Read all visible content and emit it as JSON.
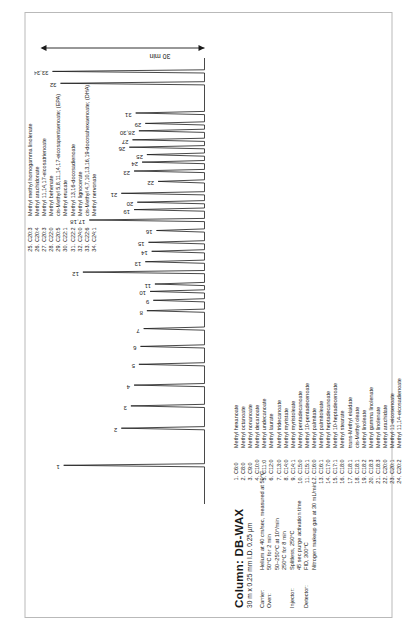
{
  "figure": {
    "column_title": "Column: DB-WAX",
    "column_subtitle": "30 m x 0.25 mm I.D.  0.25 µm",
    "axis_label": "30 min"
  },
  "method": {
    "rows": [
      {
        "label": "Carrier:",
        "values": [
          "Helium at 40 cm/sec, measured at 50°C"
        ]
      },
      {
        "label": "Oven:",
        "values": [
          "50°C for 2 min",
          "50–250°C at 10°/min",
          "250°C for 8 min"
        ]
      },
      {
        "label": "Injector:",
        "values": [
          "Splitless, 250°C",
          "45 sec purge activation time"
        ]
      },
      {
        "label": "Detector:",
        "values": [
          "FID, 300°C",
          "Nitrogen makeup gas at 30 mL/min"
        ]
      }
    ]
  },
  "compounds": {
    "column_left": [
      {
        "n": "1.",
        "code": "C6:0",
        "name": "Methyl hexanoate"
      },
      {
        "n": "2.",
        "code": "C8:0",
        "name": "Methyl octanoate"
      },
      {
        "n": "3.",
        "code": "C9:0",
        "name": "Methyl nonanoate"
      },
      {
        "n": "4.",
        "code": "C10:0",
        "name": "Methyl decanoate"
      },
      {
        "n": "5.",
        "code": "C11:0",
        "name": "Methyl undecanoate"
      },
      {
        "n": "6.",
        "code": "C12:0",
        "name": "Methyl laurate"
      },
      {
        "n": "7.",
        "code": "C13:0",
        "name": "Methyl tridecanoate"
      },
      {
        "n": "8.",
        "code": "C14:0",
        "name": "Methyl myristate"
      },
      {
        "n": "9.",
        "code": "C14:1",
        "name": "Methyl myristoleate"
      },
      {
        "n": "10.",
        "code": "C15:0",
        "name": "Methyl pentadecanoate"
      },
      {
        "n": "11.",
        "code": "C15:1",
        "name": "Methyl 10-pentadecenoate"
      },
      {
        "n": "12.",
        "code": "C16:0",
        "name": "Methyl palmitate"
      },
      {
        "n": "13.",
        "code": "C16:1",
        "name": "Methyl palmitoleate"
      },
      {
        "n": "14.",
        "code": "C17:0",
        "name": "Methyl heptadecanoate"
      },
      {
        "n": "15.",
        "code": "C17:1",
        "name": "Methyl 10-heptadecenoate"
      },
      {
        "n": "16.",
        "code": "C18:0",
        "name": "Methyl stearate"
      },
      {
        "n": "17.",
        "code": "C18:1",
        "name": "trans-Methyl elaidate"
      },
      {
        "n": "18.",
        "code": "C18:1",
        "name": "cis-Methyl oleate"
      },
      {
        "n": "19.",
        "code": "C18:2",
        "name": "Methyl linoleate"
      },
      {
        "n": "20.",
        "code": "C18:3",
        "name": "Methyl gamma linolenate"
      },
      {
        "n": "21.",
        "code": "C18:3",
        "name": "Methyl linolenate"
      },
      {
        "n": "22.",
        "code": "C20:0",
        "name": "Methyl arachidate"
      },
      {
        "n": "23.",
        "code": "C20:1",
        "name": "Methyl 11-eicosenoate"
      },
      {
        "n": "24.",
        "code": "C20:2",
        "name": "Methyl 11,14-eicosadienoate"
      }
    ],
    "column_right": [
      {
        "n": "25.",
        "code": "C20:3",
        "name": "Methyl methyl homogamma linolenate"
      },
      {
        "n": "26.",
        "code": "C20:4",
        "name": "Methyl arachidonate"
      },
      {
        "n": "27.",
        "code": "C20:3",
        "name": "Methyl 11,14,17-eicosatrienoate"
      },
      {
        "n": "28.",
        "code": "C22:0",
        "name": "Methyl behenate"
      },
      {
        "n": "29.",
        "code": "C20:5",
        "name": "cis-Methyl 5,8,11,14,17-eicosapentaenoate; (EPA)"
      },
      {
        "n": "30.",
        "code": "C22:1",
        "name": "Methyl erucate"
      },
      {
        "n": "31.",
        "code": "C22:2",
        "name": "Methyl 13,16-docosadienoate"
      },
      {
        "n": "32.",
        "code": "C24:0",
        "name": "Methyl lignocerate"
      },
      {
        "n": "33.",
        "code": "C22:6",
        "name": "cis-Methyl 4,7,10,13,16,19-docosahexaenoate; (DHA)"
      },
      {
        "n": "34.",
        "code": "C24:1",
        "name": "Methyl nervonate"
      }
    ]
  },
  "chart_data": {
    "type": "line",
    "title": "Column: DB-WAX",
    "xlabel": "30 min",
    "ylabel": "",
    "xlim": [
      0,
      30
    ],
    "ylim": [
      0,
      100
    ],
    "grid": false,
    "legend": "none",
    "annotations": [
      "30 min"
    ],
    "peak_labels": [
      "1",
      "2",
      "3",
      "4",
      "5",
      "6",
      "7",
      "8",
      "9",
      "10",
      "11",
      "12",
      "13",
      "14",
      "15",
      "16",
      "17,18",
      "19",
      "20",
      "21",
      "22",
      "23",
      "24",
      "25",
      "26",
      "27",
      "28,30",
      "29",
      "31",
      "32",
      "33,34"
    ],
    "peaks": [
      {
        "label": "1",
        "x": 2.6,
        "height": 88
      },
      {
        "label": "2",
        "x": 5.1,
        "height": 52
      },
      {
        "label": "3",
        "x": 6.6,
        "height": 46
      },
      {
        "label": "4",
        "x": 8.0,
        "height": 44
      },
      {
        "label": "5",
        "x": 9.4,
        "height": 41
      },
      {
        "label": "6",
        "x": 10.6,
        "height": 40
      },
      {
        "label": "7",
        "x": 11.8,
        "height": 38
      },
      {
        "label": "8",
        "x": 13.0,
        "height": 36
      },
      {
        "label": "9",
        "x": 13.7,
        "height": 32
      },
      {
        "label": "10",
        "x": 14.3,
        "height": 34
      },
      {
        "label": "11",
        "x": 14.8,
        "height": 31
      },
      {
        "label": "12",
        "x": 15.6,
        "height": 76
      },
      {
        "label": "13",
        "x": 16.3,
        "height": 37
      },
      {
        "label": "14",
        "x": 17.0,
        "height": 33
      },
      {
        "label": "15",
        "x": 17.6,
        "height": 35
      },
      {
        "label": "16",
        "x": 18.4,
        "height": 30
      },
      {
        "label": "17,18",
        "x": 19.1,
        "height": 72
      },
      {
        "label": "19",
        "x": 19.8,
        "height": 44
      },
      {
        "label": "20",
        "x": 20.3,
        "height": 42
      },
      {
        "label": "21",
        "x": 20.9,
        "height": 52
      },
      {
        "label": "22",
        "x": 21.7,
        "height": 29
      },
      {
        "label": "23",
        "x": 22.4,
        "height": 44
      },
      {
        "label": "24",
        "x": 23.0,
        "height": 39
      },
      {
        "label": "25",
        "x": 23.5,
        "height": 36
      },
      {
        "label": "26",
        "x": 24.0,
        "height": 47
      },
      {
        "label": "27",
        "x": 24.5,
        "height": 45
      },
      {
        "label": "28,30",
        "x": 25.1,
        "height": 41
      },
      {
        "label": "29",
        "x": 25.6,
        "height": 37
      },
      {
        "label": "31",
        "x": 26.3,
        "height": 43
      },
      {
        "label": "32",
        "x": 28.3,
        "height": 90
      },
      {
        "label": "33,34",
        "x": 29.1,
        "height": 95
      }
    ]
  }
}
